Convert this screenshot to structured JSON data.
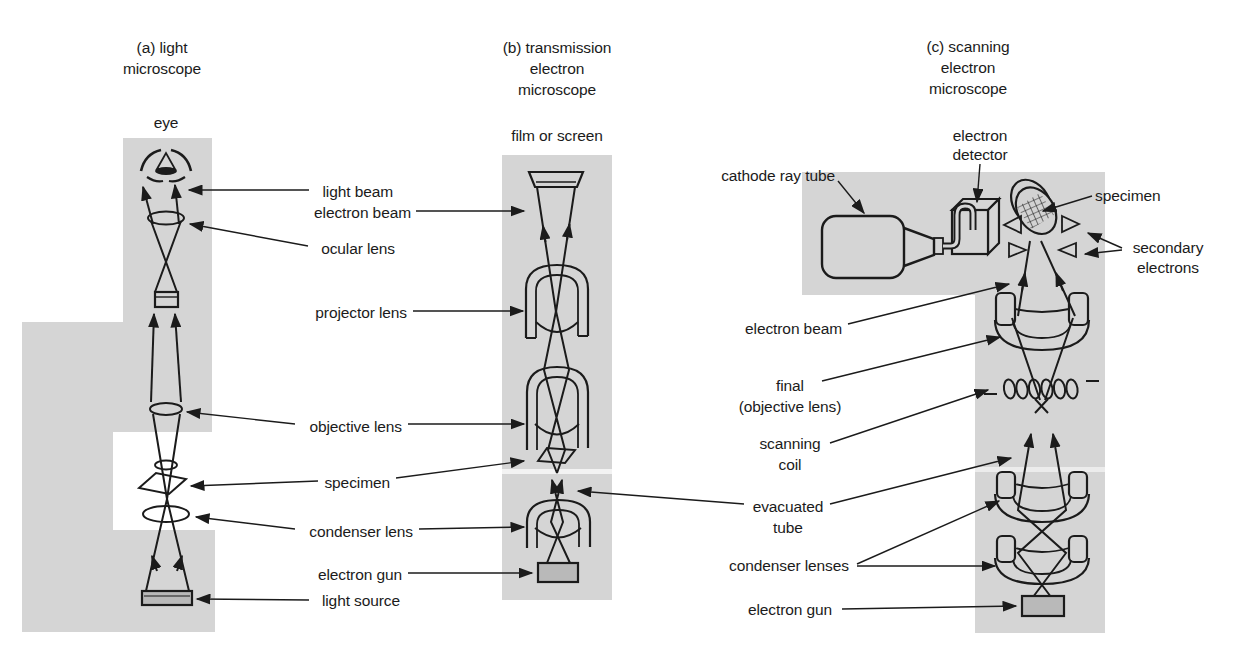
{
  "colors": {
    "background": "#ffffff",
    "panel_gray": "#d5d5d5",
    "device_gray": "#b9b9b9",
    "line": "#1b1b1b"
  },
  "panel_a": {
    "title_lines": [
      "(a) light",
      "microscope"
    ],
    "eye_label": "eye"
  },
  "panel_b": {
    "title_lines": [
      "(b) transmission",
      "electron",
      "microscope"
    ],
    "screen_label": "film or screen"
  },
  "panel_c": {
    "title_lines": [
      "(c) scanning",
      "electron",
      "microscope"
    ],
    "detector_lines": [
      "electron",
      "detector"
    ],
    "cathode_ray_tube": "cathode ray tube",
    "specimen": "specimen",
    "secondary_lines": [
      "secondary",
      "electrons"
    ],
    "electron_beam": "electron beam",
    "final_lines": [
      "final",
      "(objective lens)"
    ],
    "scanning_lines": [
      "scanning",
      "coil"
    ],
    "evacuated_lines": [
      "evacuated",
      "tube"
    ],
    "condenser_lenses": "condenser lenses",
    "electron_gun": "electron gun"
  },
  "mid_labels": {
    "light_beam": "light beam",
    "electron_beam": "electron beam",
    "ocular_lens": "ocular lens",
    "projector_lens": "projector lens",
    "objective_lens": "objective lens",
    "specimen": "specimen",
    "condenser_lens": "condenser lens",
    "electron_gun": "electron gun",
    "light_source": "light source"
  }
}
